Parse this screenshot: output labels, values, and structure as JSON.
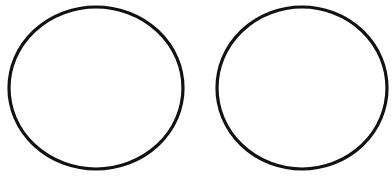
{
  "canvas": {
    "width": 392,
    "height": 184,
    "background": "#ffffff"
  },
  "shapes": [
    {
      "id": "left-circle",
      "type": "ellipse",
      "cx": 96,
      "cy": 88,
      "rx": 87,
      "ry": 81,
      "stroke": "#111111",
      "stroke_width": 3.2,
      "fill": "none"
    },
    {
      "id": "right-circle",
      "type": "ellipse",
      "cx": 302,
      "cy": 88,
      "rx": 85,
      "ry": 81,
      "stroke": "#111111",
      "stroke_width": 3.2,
      "fill": "none"
    }
  ]
}
